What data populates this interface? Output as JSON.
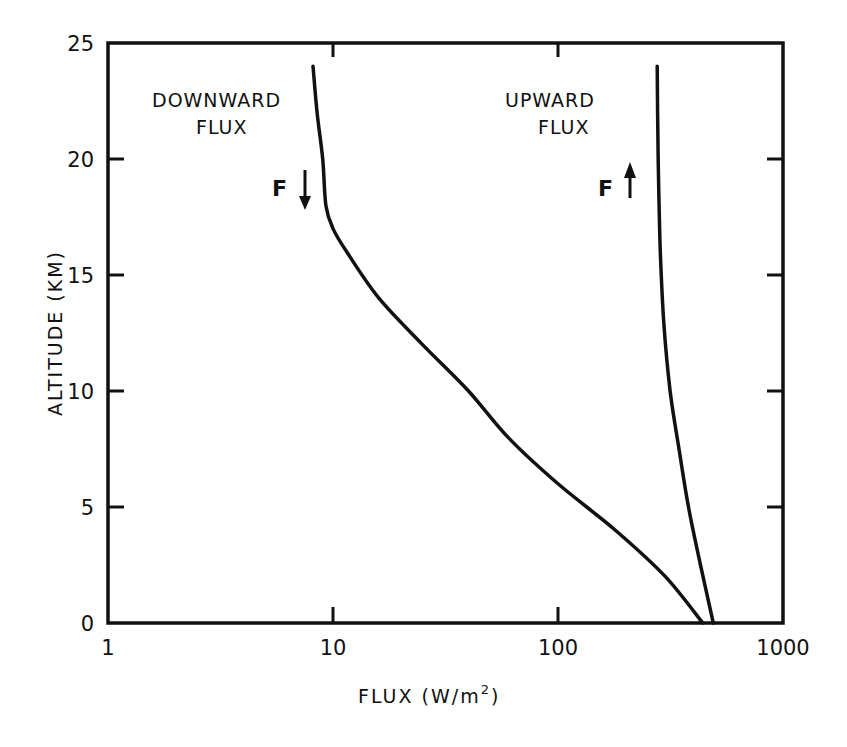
{
  "chart_data": {
    "type": "line",
    "title": "",
    "xlabel": "FLUX (W/m²)",
    "ylabel": "ALTITUDE (KM)",
    "xscale": "log",
    "xlim": [
      1,
      1000
    ],
    "ylim": [
      0,
      25
    ],
    "xticks": [
      "1",
      "10",
      "100",
      "1000"
    ],
    "yticks": [
      "0",
      "5",
      "10",
      "15",
      "20",
      "25"
    ],
    "grid": false,
    "legend": "none (inline annotations)",
    "annotations": [
      {
        "text": "DOWNWARD",
        "text2": "FLUX",
        "symbol": "F",
        "arrow": "down"
      },
      {
        "text": "UPWARD",
        "text2": "FLUX",
        "symbol": "F",
        "arrow": "up"
      }
    ],
    "series": [
      {
        "name": "Downward flux",
        "x": [
          440,
          300,
          180,
          100,
          60,
          40,
          25,
          16,
          11.5,
          10,
          9.3,
          9.0,
          8.5,
          8.15
        ],
        "y": [
          0,
          2,
          4,
          6,
          8,
          10,
          12,
          14,
          16,
          17,
          18,
          20,
          22,
          24
        ]
      },
      {
        "name": "Upward flux",
        "x": [
          490,
          430,
          380,
          345,
          315,
          295,
          285,
          280,
          277,
          276
        ],
        "y": [
          0,
          2.5,
          5,
          7.5,
          10,
          13,
          16,
          19,
          22,
          24
        ]
      }
    ]
  },
  "labels": {
    "downward_line1": "DOWNWARD",
    "downward_line2": "FLUX",
    "upward_line1": "UPWARD",
    "upward_line2": "FLUX",
    "f_symbol": "F",
    "xlabel_main": "FLUX (W/m",
    "xlabel_sup": "2",
    "xlabel_end": ")",
    "ylabel": "ALTITUDE (KM)"
  }
}
